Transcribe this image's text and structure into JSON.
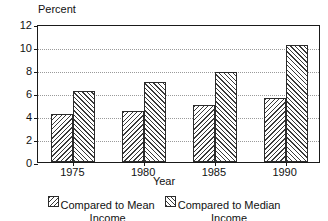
{
  "chart_data": {
    "type": "bar",
    "title": "",
    "xlabel": "Year",
    "ylabel": "Percent",
    "categories": [
      "1975",
      "1980",
      "1985",
      "1990"
    ],
    "series": [
      {
        "name": "Compared to Mean Income",
        "pattern": "backward-hatch",
        "values": [
          4.2,
          4.4,
          5.0,
          5.6
        ]
      },
      {
        "name": "Compared to Median Income",
        "pattern": "forward-hatch",
        "values": [
          6.2,
          7.0,
          7.8,
          10.2
        ]
      }
    ],
    "ylim": [
      0,
      12
    ],
    "yticks": [
      0,
      2,
      4,
      6,
      8,
      10,
      12
    ],
    "ytick_labels": [
      "0",
      "2",
      "4",
      "6",
      "8",
      "10",
      "12"
    ],
    "grid": true,
    "grid_axis": "y",
    "legend_position": "bottom-center",
    "colors": {
      "axis": "#1a1a1a",
      "grid": "#9a9a9a",
      "bar_edge": "#2b2b2b",
      "hatch": "#3a3a3a",
      "background": "#ffffff"
    }
  },
  "legend": {
    "items": [
      {
        "line1": "Compared to Mean",
        "line2": "Income"
      },
      {
        "line1": "Compared to Median",
        "line2": "Income"
      }
    ]
  }
}
